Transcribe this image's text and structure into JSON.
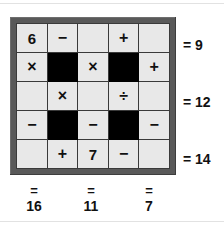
{
  "puzzle": {
    "type": "arithmetic-grid",
    "rows": 5,
    "columns": 5,
    "cells": [
      [
        {
          "text": "6",
          "kind": "number",
          "blocked": false
        },
        {
          "text": "−",
          "kind": "operator",
          "blocked": false
        },
        {
          "text": "",
          "kind": "blank",
          "blocked": false
        },
        {
          "text": "+",
          "kind": "operator",
          "blocked": false
        },
        {
          "text": "",
          "kind": "blank",
          "blocked": false
        }
      ],
      [
        {
          "text": "×",
          "kind": "operator",
          "blocked": false
        },
        {
          "text": "",
          "kind": "blocked",
          "blocked": true
        },
        {
          "text": "×",
          "kind": "operator",
          "blocked": false
        },
        {
          "text": "",
          "kind": "blocked",
          "blocked": true
        },
        {
          "text": "+",
          "kind": "operator",
          "blocked": false
        }
      ],
      [
        {
          "text": "",
          "kind": "blank",
          "blocked": false
        },
        {
          "text": "×",
          "kind": "operator",
          "blocked": false
        },
        {
          "text": "",
          "kind": "blank",
          "blocked": false
        },
        {
          "text": "÷",
          "kind": "operator",
          "blocked": false
        },
        {
          "text": "",
          "kind": "blank",
          "blocked": false
        }
      ],
      [
        {
          "text": "−",
          "kind": "operator",
          "blocked": false
        },
        {
          "text": "",
          "kind": "blocked",
          "blocked": true
        },
        {
          "text": "−",
          "kind": "operator",
          "blocked": false
        },
        {
          "text": "",
          "kind": "blocked",
          "blocked": true
        },
        {
          "text": "−",
          "kind": "operator",
          "blocked": false
        }
      ],
      [
        {
          "text": "",
          "kind": "blank",
          "blocked": false
        },
        {
          "text": "+",
          "kind": "operator",
          "blocked": false
        },
        {
          "text": "7",
          "kind": "number",
          "blocked": false
        },
        {
          "text": "−",
          "kind": "operator",
          "blocked": false
        },
        {
          "text": "",
          "kind": "blank",
          "blocked": false
        }
      ]
    ],
    "row_sums": [
      {
        "row": 1,
        "label": "= 9",
        "equals": "=",
        "value": "9"
      },
      {
        "row": 3,
        "label": "= 12",
        "equals": "=",
        "value": "12"
      },
      {
        "row": 5,
        "label": "= 14",
        "equals": "=",
        "value": "14"
      }
    ],
    "column_sums": [
      {
        "column": 1,
        "equals": "=",
        "value": "16"
      },
      {
        "column": 3,
        "equals": "=",
        "value": "11"
      },
      {
        "column": 5,
        "equals": "=",
        "value": "7"
      }
    ]
  },
  "colors": {
    "page_background": "#ffffff",
    "frame": "#595959",
    "cell_fill": "#e8e8e8",
    "cell_blocked": "#000000",
    "gridline": "#3a3a3a",
    "text": "#111111",
    "edge_rule": "#e2e2e2"
  }
}
